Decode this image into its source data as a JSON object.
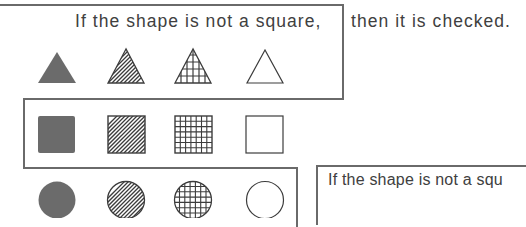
{
  "colors": {
    "fill": "#6b6b6b",
    "stroke": "#3c3c3c",
    "frame": "#6a6a6a",
    "text": "#404040",
    "background": "#ffffff"
  },
  "top_caption": {
    "inside_frame": "If the shape is not a square,",
    "outside_frame": "then it is checked."
  },
  "bottom_caption": {
    "text": "If the shape is not a squ"
  },
  "rows": [
    {
      "shape": "triangle",
      "items": [
        {
          "pattern": "solid"
        },
        {
          "pattern": "diagonal-hatch"
        },
        {
          "pattern": "grid"
        },
        {
          "pattern": "empty"
        }
      ]
    },
    {
      "shape": "square",
      "items": [
        {
          "pattern": "solid"
        },
        {
          "pattern": "diagonal-hatch"
        },
        {
          "pattern": "grid"
        },
        {
          "pattern": "empty"
        }
      ]
    },
    {
      "shape": "circle",
      "items": [
        {
          "pattern": "solid"
        },
        {
          "pattern": "diagonal-hatch"
        },
        {
          "pattern": "grid"
        },
        {
          "pattern": "empty"
        }
      ]
    }
  ]
}
